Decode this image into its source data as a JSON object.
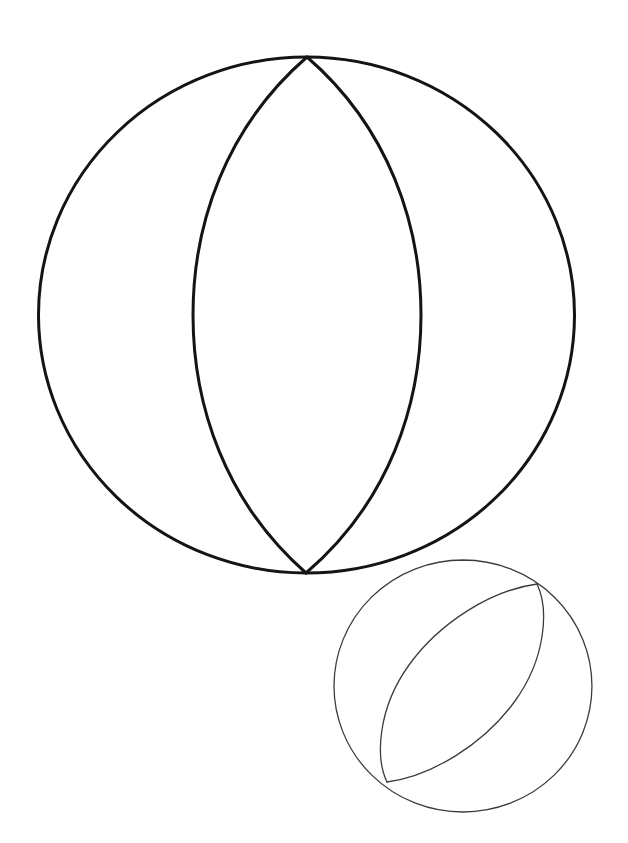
{
  "document": {
    "title": "Beach Ball Line Drawing",
    "kind": "line-art-illustration",
    "subject": "beach ball",
    "style": "coloring-book outline",
    "canvas": {
      "width": 628,
      "height": 843
    },
    "background_color": "#ffffff"
  },
  "palette": {
    "background": "#ffffff",
    "primary_stroke": "#141414",
    "secondary_stroke": "#3c3c3c",
    "fill": "none"
  },
  "figures": {
    "large_ball": {
      "name": "large-beach-ball",
      "stroke_color": "#141414",
      "stroke_width": 3,
      "outline": {
        "name": "outline-circle",
        "shape": "circle",
        "cx": 307,
        "cy": 315,
        "rx": 268,
        "ry": 258
      },
      "lens": {
        "name": "central-lens",
        "shape": "vesica",
        "tip_top": {
          "x": 307,
          "y": 57
        },
        "tip_bottom": {
          "x": 306,
          "y": 573
        },
        "half_width": 114,
        "rotation_deg": 0
      }
    },
    "small_ball": {
      "name": "small-beach-ball",
      "stroke_color": "#3c3c3c",
      "stroke_width": 1.3,
      "outline": {
        "name": "outline-circle",
        "shape": "circle",
        "cx": 463,
        "cy": 686,
        "rx": 129,
        "ry": 126
      },
      "lens": {
        "name": "central-lens",
        "shape": "vesica",
        "tip_top": {
          "x": 537,
          "y": 584
        },
        "tip_bottom": {
          "x": 387,
          "y": 782
        },
        "half_width": 57,
        "rotation_deg": 37
      }
    }
  },
  "geometry_paths": {
    "large_outline": "M 307 57 A 268 258 0 1 1 306 573 A 268 258 0 1 1 307 57 Z",
    "large_lens_left": "M 307 57 C 225 128 193 225 193 315 C 193 405 225 502 306 573",
    "large_lens_right": "M 307 57 C 389 128 421 225 421 315 C 421 405 389 502 306 573",
    "small_outline": "M 463 560 A 129 126 0 1 1 462.9 812 A 129 126 0 1 1 463 560 Z",
    "small_lens_upper": "M 537 584 C 492 590 440 622 409 665 C 378 708 375 757 387 782",
    "small_lens_lower": "M 537 584 C 549 609 546 658 515 701 C 484 744 432 776 387 782"
  }
}
